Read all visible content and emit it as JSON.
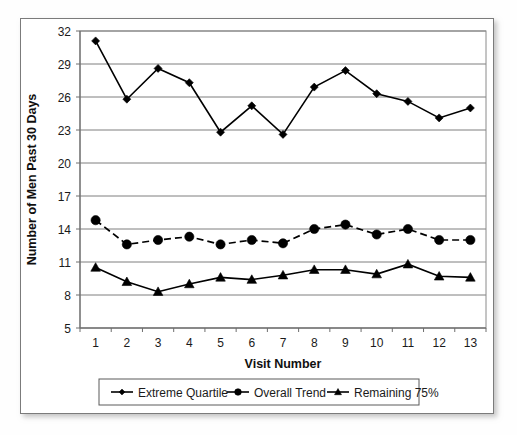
{
  "chart_data": {
    "type": "line",
    "title": "",
    "xlabel": "Visit Number",
    "ylabel": "Number of Men Past 30  Days",
    "categories": [
      "1",
      "2",
      "3",
      "4",
      "5",
      "6",
      "7",
      "8",
      "9",
      "10",
      "11",
      "12",
      "13"
    ],
    "x": [
      1,
      2,
      3,
      4,
      5,
      6,
      7,
      8,
      9,
      10,
      11,
      12,
      13
    ],
    "ylim": [
      5,
      32
    ],
    "yticks": [
      5,
      8,
      11,
      14,
      17,
      20,
      23,
      26,
      29,
      32
    ],
    "ytick_labels": [
      "5",
      "8",
      "11",
      "14",
      "17",
      "20",
      "23",
      "26",
      "29",
      "32"
    ],
    "grid": "horizontal",
    "legend_position": "bottom",
    "series": [
      {
        "name": "Extreme Quartile",
        "marker": "diamond",
        "line_style": "solid",
        "color": "#000000",
        "values": [
          31.1,
          25.8,
          28.6,
          27.3,
          22.8,
          25.2,
          22.6,
          26.9,
          28.4,
          26.3,
          25.6,
          24.1,
          25.0
        ]
      },
      {
        "name": "Overall Trend",
        "marker": "circle",
        "line_style": "dashed",
        "color": "#000000",
        "values": [
          14.8,
          12.6,
          13.0,
          13.3,
          12.6,
          13.0,
          12.7,
          14.0,
          14.4,
          13.5,
          14.0,
          13.0,
          13.0
        ]
      },
      {
        "name": "Remaining 75%",
        "marker": "triangle",
        "line_style": "solid",
        "color": "#000000",
        "values": [
          10.5,
          9.2,
          8.3,
          9.0,
          9.6,
          9.4,
          9.8,
          10.3,
          10.3,
          9.9,
          10.8,
          9.7,
          9.6
        ]
      }
    ]
  },
  "axes": {
    "y_title": "Number of Men Past 30  Days",
    "x_title": "Visit Number"
  },
  "legend": {
    "items": [
      {
        "label": "Extreme Quartile",
        "marker": "diamond"
      },
      {
        "label": "Overall Trend",
        "marker": "circle"
      },
      {
        "label": "Remaining 75%",
        "marker": "triangle"
      }
    ]
  }
}
